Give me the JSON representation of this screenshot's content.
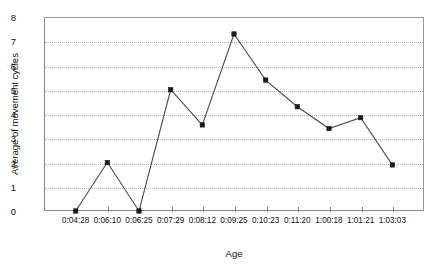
{
  "chart_data": {
    "type": "line",
    "title": "",
    "xlabel": "Age",
    "ylabel": "Average of movement cycles",
    "categories": [
      "0:04:28",
      "0:06:10",
      "0:06:25",
      "0:07:29",
      "0:08:12",
      "0:09:25",
      "0:10:23",
      "0:11:20",
      "1:00:18",
      "1:01:21",
      "1:03:03"
    ],
    "values": [
      0,
      2.0,
      0,
      5.0,
      3.55,
      7.3,
      5.4,
      4.3,
      3.4,
      3.85,
      1.9
    ],
    "series": [
      {
        "name": "Average of movement cycles",
        "values": [
          0,
          2.0,
          0,
          5.0,
          3.55,
          7.3,
          5.4,
          4.3,
          3.4,
          3.85,
          1.9
        ]
      }
    ],
    "ylim": [
      0,
      8
    ],
    "yticks": [
      0,
      1,
      2,
      3,
      4,
      5,
      6,
      7,
      8
    ],
    "ytick_labels": [
      "0",
      "1",
      "2",
      "3",
      "4",
      "5",
      "6",
      "7",
      "8"
    ],
    "grid": true,
    "grid_axis": "y",
    "grid_style": "dotted",
    "legend": false,
    "legend_position": "none",
    "marker": "filled-square",
    "line_color": "#4d4d4d",
    "marker_color": "#1a1a1a",
    "grid_color": "#b6b6b6",
    "axis_color": "#8a8a8a",
    "background_color": "#ffffff"
  }
}
